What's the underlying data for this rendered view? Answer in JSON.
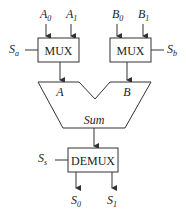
{
  "diagram": {
    "inputs_a": [
      {
        "base": "A",
        "sub": "0"
      },
      {
        "base": "A",
        "sub": "1"
      }
    ],
    "inputs_b": [
      {
        "base": "B",
        "sub": "0"
      },
      {
        "base": "B",
        "sub": "1"
      }
    ],
    "mux_left": {
      "label": "MUX",
      "select": {
        "base": "S",
        "sub": "a"
      }
    },
    "mux_right": {
      "label": "MUX",
      "select": {
        "base": "S",
        "sub": "b"
      }
    },
    "adder": {
      "input_a": "A",
      "input_b": "B",
      "output": "Sum"
    },
    "demux": {
      "label": "DEMUX",
      "select": {
        "base": "S",
        "sub": "s"
      }
    },
    "outputs": [
      {
        "base": "S",
        "sub": "0"
      },
      {
        "base": "S",
        "sub": "1"
      }
    ],
    "colors": {
      "stroke": "#333333",
      "text": "#222222",
      "background": "#ffffff"
    }
  }
}
